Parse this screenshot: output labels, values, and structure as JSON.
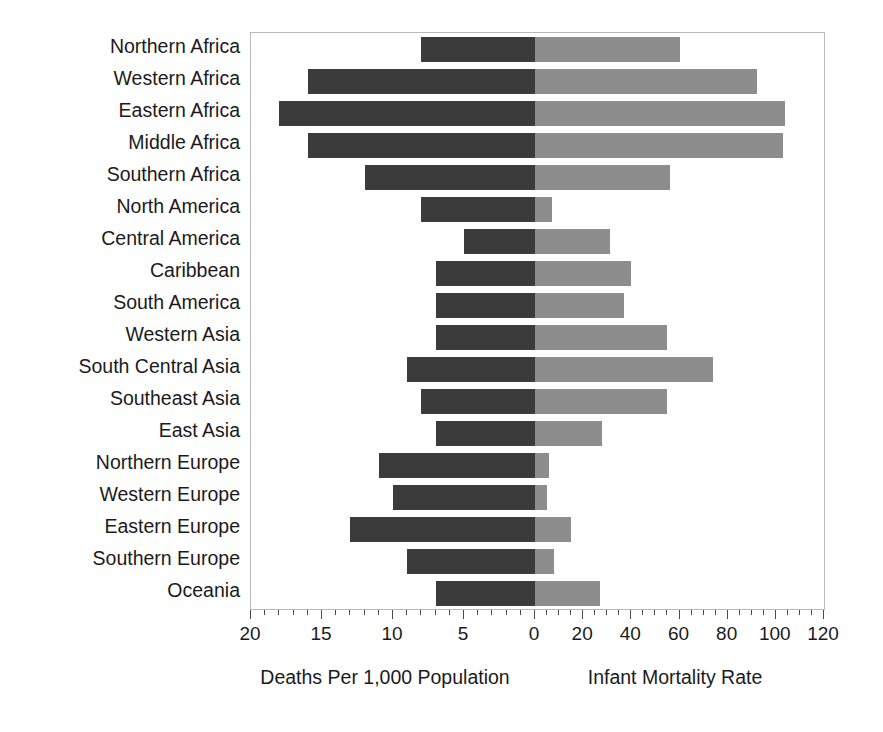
{
  "chart_data": {
    "type": "bar",
    "subtype": "back-to-back population pyramid style horizontal bar chart",
    "title": "",
    "categories": [
      "Northern Africa",
      "Western Africa",
      "Eastern Africa",
      "Middle Africa",
      "Southern Africa",
      "North America",
      "Central America",
      "Caribbean",
      "South America",
      "Western Asia",
      "South Central Asia",
      "Southeast Asia",
      "East Asia",
      "Northern Europe",
      "Western Europe",
      "Eastern Europe",
      "Southern Europe",
      "Oceania"
    ],
    "series": [
      {
        "name": "Deaths Per 1,000 Population",
        "side": "left",
        "color": "#3b3b3b",
        "axis_label": "Deaths Per 1,000 Population",
        "ticks": [
          20,
          15,
          10,
          5,
          0
        ],
        "range": [
          20,
          0
        ],
        "values": [
          8,
          16,
          18,
          16,
          12,
          8,
          5,
          7,
          7,
          7,
          9,
          8,
          7,
          11,
          10,
          13,
          9,
          7
        ]
      },
      {
        "name": "Infant Mortality Rate",
        "side": "right",
        "color": "#8d8d8d",
        "axis_label": "Infant Mortality Rate",
        "ticks": [
          0,
          20,
          40,
          60,
          80,
          100,
          120
        ],
        "range": [
          0,
          120
        ],
        "values": [
          60,
          92,
          104,
          103,
          56,
          7,
          31,
          40,
          37,
          55,
          74,
          55,
          28,
          6,
          5,
          15,
          8,
          27
        ]
      }
    ],
    "xlabel_left": "Deaths Per 1,000 Population",
    "xlabel_right": "Infant Mortality Rate",
    "ylabel": "",
    "grid": false,
    "legend": false,
    "minor_ticks_left_interval": 1,
    "minor_ticks_right_interval": 5
  },
  "axis": {
    "left_tick_labels": [
      "20",
      "15",
      "10",
      "5",
      "0"
    ],
    "right_tick_labels": [
      "20",
      "40",
      "60",
      "80",
      "100",
      "120"
    ],
    "left_title": "Deaths Per 1,000 Population",
    "right_title": "Infant Mortality Rate"
  }
}
